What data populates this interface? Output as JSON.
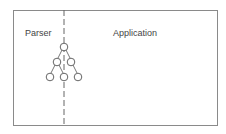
{
  "diagram": {
    "left_label": "Parser",
    "right_label": "Application",
    "tree": {
      "nodes": [
        {
          "id": "root",
          "x": 64,
          "y": 47
        },
        {
          "id": "l2a",
          "x": 57,
          "y": 62
        },
        {
          "id": "l2b",
          "x": 71,
          "y": 62
        },
        {
          "id": "l3a",
          "x": 50,
          "y": 77
        },
        {
          "id": "l3b",
          "x": 64,
          "y": 77
        },
        {
          "id": "l3c",
          "x": 78,
          "y": 77
        }
      ],
      "edges": [
        [
          "root",
          "l2a"
        ],
        [
          "root",
          "l2b"
        ],
        [
          "l2a",
          "l3a"
        ],
        [
          "l2a",
          "l3b"
        ],
        [
          "l2b",
          "l3c"
        ]
      ]
    },
    "divider": "dashed vertical line separating Parser and Application"
  }
}
